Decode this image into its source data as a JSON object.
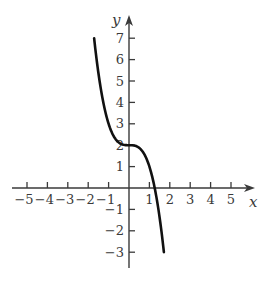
{
  "chart_data": {
    "type": "line",
    "title": "",
    "xlabel": "x",
    "ylabel": "y",
    "function": "y = 2 - x^3",
    "xlim": [
      -5.5,
      6
    ],
    "ylim": [
      -3.8,
      8
    ],
    "x_ticks": [
      -5,
      -4,
      -3,
      -2,
      -1,
      1,
      2,
      3,
      4,
      5
    ],
    "y_ticks": [
      -3,
      -2,
      -1,
      1,
      2,
      3,
      4,
      5,
      6,
      7
    ],
    "x_tick_labels": [
      "−5",
      "−4",
      "−3",
      "−2",
      "−1",
      "1",
      "2",
      "3",
      "4",
      "5"
    ],
    "y_tick_labels": [
      "−3",
      "−2",
      "−1",
      "1",
      "2",
      "3",
      "4",
      "5",
      "6",
      "7"
    ],
    "grid": false,
    "legend": null,
    "series": [
      {
        "name": "curve",
        "x": [
          -1.71,
          -1.5,
          -1.25,
          -1.0,
          -0.75,
          -0.5,
          -0.25,
          0,
          0.25,
          0.5,
          0.75,
          1.0,
          1.25,
          1.5,
          1.71
        ],
        "y": [
          7.0,
          5.38,
          3.95,
          3.0,
          2.42,
          2.13,
          2.02,
          2.0,
          1.98,
          1.88,
          1.58,
          1.0,
          0.05,
          -1.38,
          -3.0
        ]
      }
    ],
    "domain": [
      -1.71,
      1.71
    ]
  },
  "colors": {
    "axis": "#3a3a3a",
    "curve": "#111111",
    "background": "#ffffff"
  }
}
